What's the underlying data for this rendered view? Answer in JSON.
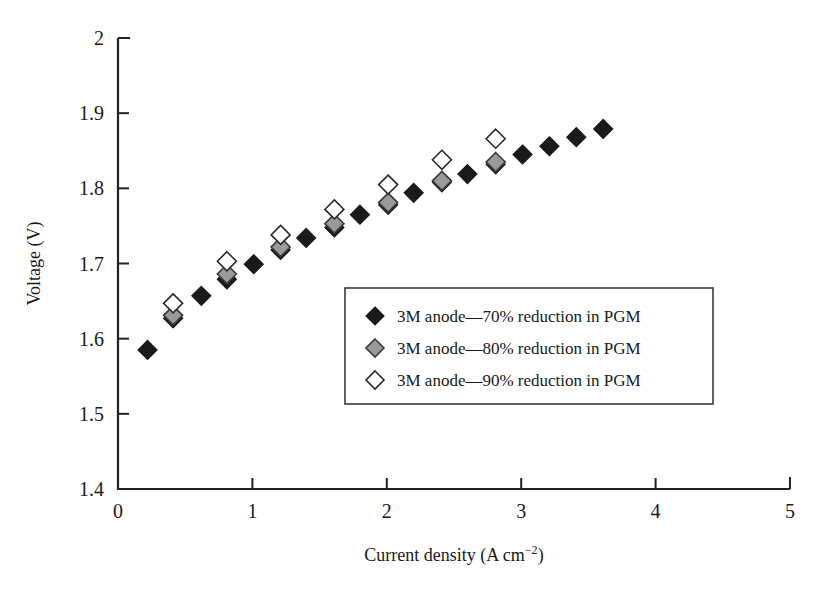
{
  "chart_data": {
    "type": "scatter",
    "title": "",
    "xlabel": "Current density (A cm−2)",
    "xlabel_base": "Current density (A cm",
    "xlabel_sup": "−2",
    "xlabel_tail": ")",
    "ylabel": "Voltage (V)",
    "xlim": [
      0,
      5
    ],
    "ylim": [
      1.4,
      2.0
    ],
    "xticks": [
      0,
      1,
      2,
      3,
      4,
      5
    ],
    "xtick_labels": [
      "0",
      "1",
      "2",
      "3",
      "4",
      "5"
    ],
    "yticks": [
      1.4,
      1.5,
      1.6,
      1.7,
      1.8,
      1.9,
      2.0
    ],
    "ytick_labels": [
      "1.4",
      "1.5",
      "1.6",
      "1.7",
      "1.8",
      "1.9",
      "2"
    ],
    "grid": false,
    "legend_position": "center",
    "series": [
      {
        "name": "3M anode—70% reduction in PGM",
        "marker": "filled-diamond",
        "color": "#1a1a1a",
        "fill": "#1a1a1a",
        "points": [
          {
            "x": 0.22,
            "y": 1.585
          },
          {
            "x": 0.62,
            "y": 1.657
          },
          {
            "x": 1.01,
            "y": 1.699
          },
          {
            "x": 1.4,
            "y": 1.734
          },
          {
            "x": 1.8,
            "y": 1.765
          },
          {
            "x": 2.2,
            "y": 1.794
          },
          {
            "x": 2.6,
            "y": 1.819
          },
          {
            "x": 3.01,
            "y": 1.845
          },
          {
            "x": 3.21,
            "y": 1.856
          },
          {
            "x": 3.41,
            "y": 1.868
          },
          {
            "x": 3.61,
            "y": 1.879
          },
          {
            "x": 0.41,
            "y": 1.627
          },
          {
            "x": 0.81,
            "y": 1.679
          },
          {
            "x": 1.21,
            "y": 1.718
          },
          {
            "x": 1.61,
            "y": 1.748
          },
          {
            "x": 2.01,
            "y": 1.778
          },
          {
            "x": 2.41,
            "y": 1.808
          },
          {
            "x": 2.81,
            "y": 1.832
          }
        ]
      },
      {
        "name": "3M anode—80% reduction in PGM",
        "marker": "gray-diamond",
        "color": "#3a3a3a",
        "fill": "#9a9a9a",
        "points": [
          {
            "x": 0.41,
            "y": 1.631
          },
          {
            "x": 0.81,
            "y": 1.686
          },
          {
            "x": 1.21,
            "y": 1.722
          },
          {
            "x": 1.61,
            "y": 1.753
          },
          {
            "x": 2.01,
            "y": 1.781
          },
          {
            "x": 2.41,
            "y": 1.81
          },
          {
            "x": 2.81,
            "y": 1.835
          }
        ]
      },
      {
        "name": "3M anode—90% reduction in PGM",
        "marker": "open-diamond",
        "color": "#2a2a2a",
        "fill": "#ffffff",
        "points": [
          {
            "x": 0.41,
            "y": 1.647
          },
          {
            "x": 0.81,
            "y": 1.703
          },
          {
            "x": 1.21,
            "y": 1.738
          },
          {
            "x": 1.61,
            "y": 1.772
          },
          {
            "x": 2.01,
            "y": 1.805
          },
          {
            "x": 2.41,
            "y": 1.838
          },
          {
            "x": 2.81,
            "y": 1.866
          }
        ]
      }
    ]
  }
}
